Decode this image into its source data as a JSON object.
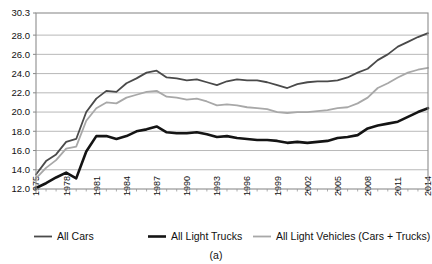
{
  "chart_data": {
    "type": "line",
    "title": "",
    "subtitle": "",
    "caption": "(a)",
    "xlabel": "",
    "ylabel": "",
    "grid": true,
    "legend_position": "bottom",
    "xlim": [
      1975,
      2014
    ],
    "ylim": [
      12.0,
      30.3
    ],
    "yticks": [
      "30.3",
      "28.0",
      "26.0",
      "24.0",
      "22.0",
      "20.0",
      "18.0",
      "16.0",
      "14.0",
      "12.0"
    ],
    "ytick_values": [
      30.3,
      28.0,
      26.0,
      24.0,
      22.0,
      20.0,
      18.0,
      16.0,
      14.0,
      12.0
    ],
    "xticks": [
      "1975",
      "1978",
      "1981",
      "1984",
      "1987",
      "1990",
      "1993",
      "1996",
      "1999",
      "2002",
      "2005",
      "2008",
      "2011",
      "2014"
    ],
    "xtick_values": [
      1975,
      1978,
      1981,
      1984,
      1987,
      1990,
      1993,
      1996,
      1999,
      2002,
      2005,
      2008,
      2011,
      2014
    ],
    "x": [
      1975,
      1976,
      1977,
      1978,
      1979,
      1980,
      1981,
      1982,
      1983,
      1984,
      1985,
      1986,
      1987,
      1988,
      1989,
      1990,
      1991,
      1992,
      1993,
      1994,
      1995,
      1996,
      1997,
      1998,
      1999,
      2000,
      2001,
      2002,
      2003,
      2004,
      2005,
      2006,
      2007,
      2008,
      2009,
      2010,
      2011,
      2012,
      2013,
      2014
    ],
    "series": [
      {
        "name": "All Cars",
        "color": "#4a4a4a",
        "width": 1.8,
        "values": [
          13.5,
          14.9,
          15.6,
          16.9,
          17.2,
          20.0,
          21.4,
          22.2,
          22.1,
          23.0,
          23.5,
          24.1,
          24.3,
          23.6,
          23.5,
          23.3,
          23.4,
          23.1,
          22.8,
          23.2,
          23.4,
          23.3,
          23.3,
          23.1,
          22.8,
          22.5,
          22.9,
          23.1,
          23.2,
          23.2,
          23.3,
          23.6,
          24.1,
          24.5,
          25.4,
          26.0,
          26.8,
          27.3,
          27.8,
          28.2
        ]
      },
      {
        "name": "All Light Trucks",
        "color": "#141414",
        "width": 2.6,
        "values": [
          12.1,
          12.6,
          13.2,
          13.7,
          13.1,
          15.9,
          17.5,
          17.5,
          17.2,
          17.5,
          18.0,
          18.2,
          18.5,
          17.9,
          17.8,
          17.8,
          17.9,
          17.7,
          17.4,
          17.5,
          17.3,
          17.2,
          17.1,
          17.1,
          17.0,
          16.8,
          16.9,
          16.8,
          16.9,
          17.0,
          17.3,
          17.4,
          17.6,
          18.3,
          18.6,
          18.8,
          19.0,
          19.5,
          20.0,
          20.4
        ]
      },
      {
        "name": "All Light Vehicles (Cars + Trucks)",
        "color": "#a8a8a8",
        "width": 1.8,
        "values": [
          13.1,
          14.2,
          15.0,
          16.2,
          16.4,
          19.1,
          20.4,
          21.0,
          20.9,
          21.5,
          21.8,
          22.1,
          22.2,
          21.6,
          21.5,
          21.3,
          21.4,
          21.1,
          20.7,
          20.8,
          20.7,
          20.5,
          20.4,
          20.3,
          20.0,
          19.9,
          20.0,
          20.0,
          20.1,
          20.2,
          20.4,
          20.5,
          20.9,
          21.5,
          22.5,
          23.0,
          23.6,
          24.1,
          24.4,
          24.6
        ]
      }
    ],
    "legend": [
      {
        "label": "All Cars",
        "color": "#4a4a4a",
        "width": 1.8
      },
      {
        "label": "All Light Trucks",
        "color": "#141414",
        "width": 2.6
      },
      {
        "label": "All Light Vehicles (Cars + Trucks)",
        "color": "#a8a8a8",
        "width": 1.8
      }
    ]
  }
}
